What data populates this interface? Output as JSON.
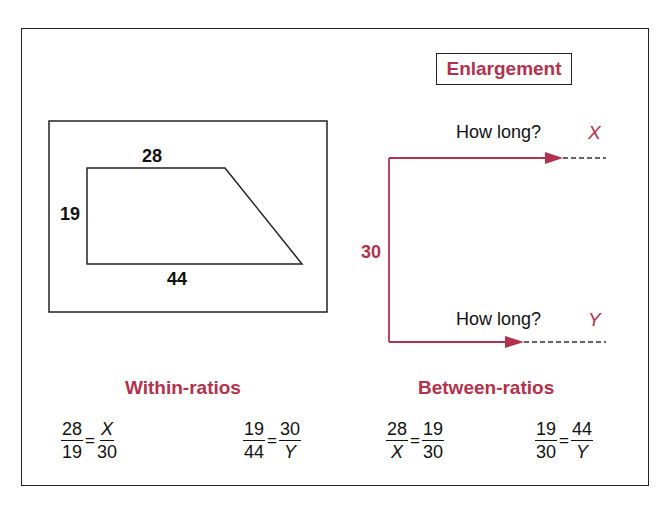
{
  "title_badge": "Enlargement",
  "original_shape": {
    "type": "trapezoid",
    "top": "28",
    "left": "19",
    "bottom": "44"
  },
  "enlargement": {
    "side": "30",
    "top_arrow": {
      "question": "How long?",
      "variable": "X"
    },
    "bottom_arrow": {
      "question": "How long?",
      "variable": "Y"
    }
  },
  "within_ratios": {
    "heading": "Within-ratios",
    "equations": [
      {
        "lhs": {
          "num": "28",
          "den": "19"
        },
        "rhs": {
          "num": "X",
          "den": "30"
        }
      },
      {
        "lhs": {
          "num": "19",
          "den": "44"
        },
        "rhs": {
          "num": "30",
          "den": "Y"
        }
      }
    ]
  },
  "between_ratios": {
    "heading": "Between-ratios",
    "equations": [
      {
        "lhs": {
          "num": "28",
          "den": "X"
        },
        "rhs": {
          "num": "19",
          "den": "30"
        }
      },
      {
        "lhs": {
          "num": "19",
          "den": "30"
        },
        "rhs": {
          "num": "44",
          "den": "Y"
        }
      }
    ]
  },
  "equals_sign": "=",
  "colors": {
    "accent": "#b2324d",
    "line": "#222222"
  }
}
